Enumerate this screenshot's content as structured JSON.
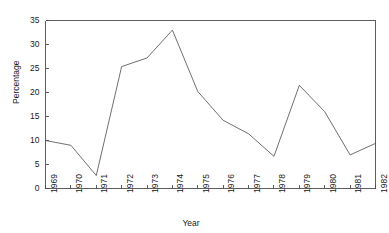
{
  "chart_data": {
    "type": "line",
    "title": "",
    "xlabel": "Year",
    "ylabel": "Percentage",
    "categories": [
      "1969",
      "1970",
      "1971",
      "1972",
      "1973",
      "1974",
      "1975",
      "1976",
      "1977",
      "1978",
      "1979",
      "1980",
      "1981",
      "1982"
    ],
    "x": [
      1969,
      1970,
      1971,
      1972,
      1973,
      1974,
      1975,
      1976,
      1977,
      1978,
      1979,
      1980,
      1981,
      1982
    ],
    "values": [
      10.0,
      9.0,
      2.7,
      25.4,
      27.2,
      33.0,
      20.2,
      14.2,
      11.4,
      6.7,
      21.5,
      16.0,
      7.0,
      9.4
    ],
    "series": [
      {
        "name": "Percentage",
        "values": [
          10.0,
          9.0,
          2.7,
          25.4,
          27.2,
          33.0,
          20.2,
          14.2,
          11.4,
          6.7,
          21.5,
          16.0,
          7.0,
          9.4
        ]
      }
    ],
    "ylim": [
      0,
      35
    ],
    "yticks": [
      0,
      5,
      10,
      15,
      20,
      25,
      30,
      35
    ],
    "ytick_labels": [
      "0",
      "5",
      "10",
      "15",
      "20",
      "25",
      "30",
      "35"
    ],
    "xlim": [
      1969,
      1982
    ],
    "grid": false,
    "legend": false,
    "line_color": "#555555",
    "axis_color": "#4d4d4d",
    "background_color": "#ffffff"
  }
}
